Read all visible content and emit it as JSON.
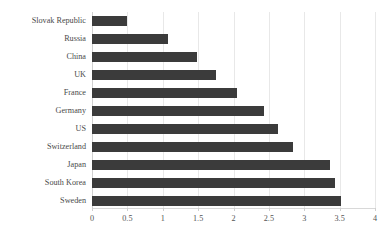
{
  "chart_data": {
    "type": "bar",
    "orientation": "horizontal",
    "title": "",
    "subtitle": "",
    "xlabel": "",
    "ylabel": "",
    "xlim": [
      0,
      4
    ],
    "xticks": [
      "0",
      "0.5",
      "1",
      "1.5",
      "2",
      "2.5",
      "3",
      "3.5",
      "4"
    ],
    "xtick_values": [
      0,
      0.5,
      1,
      1.5,
      2,
      2.5,
      3,
      3.5,
      4
    ],
    "grid": true,
    "legend": false,
    "bar_color": "#3b3b3b",
    "grid_color": "#e8e8e8",
    "categories": [
      "Slovak Republic",
      "Russia",
      "China",
      "UK",
      "France",
      "Germany",
      "US",
      "Switzerland",
      "Japan",
      "South Korea",
      "Sweden"
    ],
    "values": [
      0.5,
      1.07,
      1.48,
      1.75,
      2.05,
      2.43,
      2.63,
      2.84,
      3.36,
      3.43,
      3.52
    ]
  }
}
